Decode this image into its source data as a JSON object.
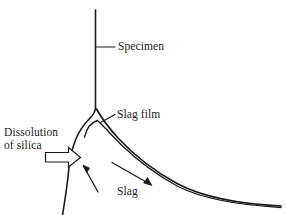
{
  "figure": {
    "kind": "schematic-diagram",
    "background_color": "#ffffff",
    "line_color": "#1a1a1a",
    "text_color": "#1a1a1a"
  },
  "labels": {
    "specimen": "Specimen",
    "slag_film": "Slag film",
    "dissolution_line1": "Dissolution",
    "dissolution_line2": "of silica",
    "slag": "Slag"
  },
  "annotations": {
    "dissolution_arrow": "block-arrow-right",
    "slag_flow_arrow": "flow-arrow-down-right",
    "upward_flow_arrow": "flow-arrow-up-left",
    "specimen_leader": "leader-line-horizontal",
    "slag_film_leader": "leader-line-diagonal"
  },
  "geometry": {
    "specimen_edge": "vertical line from top, curving left then down at the nose",
    "slag_outer_curve": "curve sweeping from nose down-right to the right edge",
    "slag_film_inner_curve": "thin inner curve forming tapering film layer"
  }
}
